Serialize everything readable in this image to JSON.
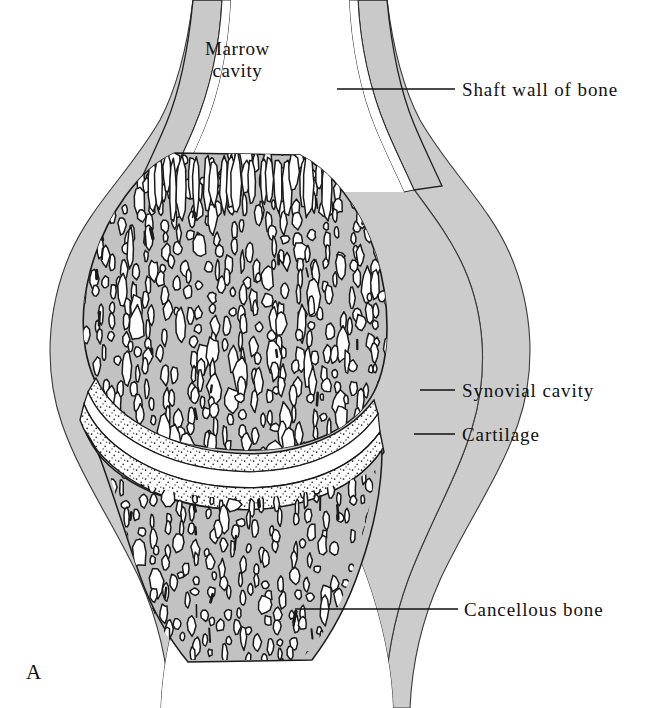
{
  "figure": {
    "panel_letter": "A"
  },
  "labels": {
    "marrow_cavity": {
      "line1": "Marrow",
      "line2": "cavity"
    },
    "shaft_wall": "Shaft wall of bone",
    "synovial_cavity": "Synovial cavity",
    "cartilage": "Cartilage",
    "cancellous_bone": "Cancellous bone"
  },
  "colors": {
    "background": "#ffffff",
    "bone_gray": "#c9c9c9",
    "capsule_gray": "#cccccc",
    "trabecular_fill": "#c2c2c2",
    "marrow_space": "#ffffff",
    "outline": "#1a1a1a",
    "thin_outline": "#333333",
    "cartilage_white": "#ffffff",
    "stipple": "#2a2a2a",
    "leader_line": "#111111",
    "text": "#111111"
  },
  "geometry": {
    "width": 660,
    "height": 708,
    "leaders": [
      {
        "name": "shaft-wall",
        "x1": 337,
        "y1": 89,
        "x2": 455,
        "y2": 89
      },
      {
        "name": "synovial-cavity",
        "x1": 420,
        "y1": 390,
        "x2": 455,
        "y2": 390
      },
      {
        "name": "cartilage",
        "x1": 414,
        "y1": 434,
        "x2": 455,
        "y2": 434
      },
      {
        "name": "cancellous-bone",
        "x1": 295,
        "y1": 609,
        "x2": 458,
        "y2": 609
      }
    ],
    "label_positions": [
      {
        "name": "marrow-cavity",
        "left": 205,
        "top": 38
      },
      {
        "name": "shaft-wall",
        "left": 462,
        "top": 79
      },
      {
        "name": "synovial-cavity",
        "left": 462,
        "top": 380
      },
      {
        "name": "cartilage",
        "left": 462,
        "top": 424
      },
      {
        "name": "cancellous-bone",
        "left": 464,
        "top": 599
      },
      {
        "name": "panel-letter",
        "left": 26,
        "top": 660
      }
    ]
  }
}
